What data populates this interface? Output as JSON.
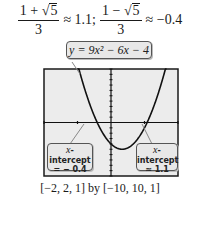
{
  "equations": {
    "root1": {
      "numerator_left": "1 + ",
      "radicand": "5",
      "denominator": "3",
      "approx": "≈ 1.1;"
    },
    "root2": {
      "numerator_left": "1 − ",
      "radicand": "5",
      "denominator": "3",
      "approx": "≈ −0.4"
    },
    "sqrt_symbol": "√"
  },
  "function_label": "y = 9x² − 6x − 4",
  "callouts": {
    "left": {
      "line1_var": "x",
      "line1_rest": "-intercept",
      "line2": "= − 0.4"
    },
    "right": {
      "line1_var": "x",
      "line1_rest": "-intercept",
      "line2": "≈ 1.1"
    }
  },
  "window_label": "[−2, 2, 1] by [−10, 10, 1]",
  "chart_data": {
    "type": "line",
    "title": "y = 9x² − 6x − 4",
    "function": "9x^2 - 6x - 4",
    "xlim": [
      -2,
      2
    ],
    "ylim": [
      -10,
      10
    ],
    "xscl": 1,
    "yscl": 1,
    "grid": false,
    "x": [
      -2,
      -1.5,
      -1,
      -0.5,
      -0.4,
      0,
      0.333,
      0.5,
      1,
      1.1,
      1.5,
      2
    ],
    "y": [
      44,
      25.25,
      11,
      1.25,
      0,
      -4,
      -5,
      -4.75,
      -1,
      0,
      7.25,
      20
    ],
    "annotations": [
      {
        "label": "x-intercept = −0.4",
        "x": -0.4,
        "y": 0
      },
      {
        "label": "x-intercept ≈ 1.1",
        "x": 1.1,
        "y": 0
      }
    ],
    "xlabel": "",
    "ylabel": "",
    "window": "[−2, 2, 1] by [−10, 10, 1]"
  },
  "colors": {
    "screen_bg": "#ececec",
    "frame": "#1a1a1a",
    "curve": "#111111",
    "callout_bg": "#e8e8e8"
  }
}
